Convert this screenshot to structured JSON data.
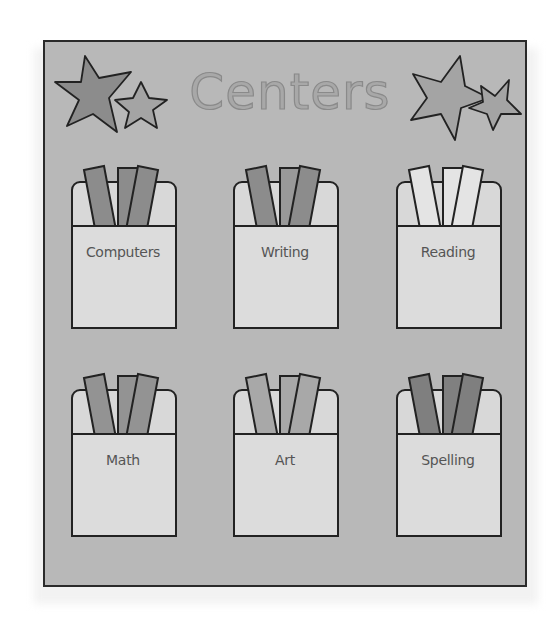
{
  "board": {
    "title": "Centers",
    "background_color": "#b8b8b8",
    "border_color": "#2a2a2a"
  },
  "stars": [
    {
      "name": "left-large-star",
      "fill": "#8c8c8c"
    },
    {
      "name": "left-small-star",
      "fill": "#a4a4a4"
    },
    {
      "name": "right-large-star",
      "fill": "#a4a4a4"
    },
    {
      "name": "right-small-star",
      "fill": "#a4a4a4"
    }
  ],
  "pockets": [
    {
      "label": "Computers",
      "card_colors": [
        "#8c8c8c",
        "#8c8c8c",
        "#8c8c8c"
      ]
    },
    {
      "label": "Writing",
      "card_colors": [
        "#8c8c8c",
        "#999999",
        "#8c8c8c"
      ]
    },
    {
      "label": "Reading",
      "card_colors": [
        "#e4e4e4",
        "#e4e4e4",
        "#e4e4e4"
      ]
    },
    {
      "label": "Math",
      "card_colors": [
        "#939393",
        "#939393",
        "#939393"
      ]
    },
    {
      "label": "Art",
      "card_colors": [
        "#a8a8a8",
        "#a8a8a8",
        "#a8a8a8"
      ]
    },
    {
      "label": "Spelling",
      "card_colors": [
        "#7f7f7f",
        "#808080",
        "#7f7f7f"
      ]
    }
  ]
}
